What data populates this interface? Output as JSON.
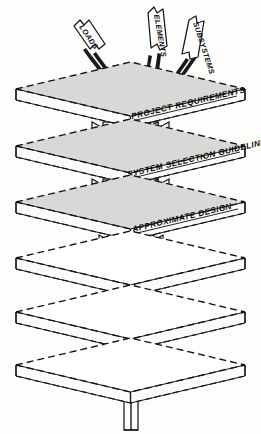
{
  "figure": {
    "background_color": "#fdfdfc",
    "ink_color": "#141414",
    "plate_shade_color": "#d8d8d6",
    "width": 261,
    "height": 434
  },
  "input_arrows": [
    {
      "id": "loads",
      "label": "LOADS"
    },
    {
      "id": "elements",
      "label": "ELEMENTS"
    },
    {
      "id": "subsystems",
      "label": "SUBSYSTEMS"
    }
  ],
  "plates": [
    {
      "index": 1,
      "label": "PROJECT  REQUIREMENTS",
      "shaded": true,
      "labeled": true
    },
    {
      "index": 2,
      "label": "SYSTEM  SELECTION  GUIDELINES",
      "shaded": true,
      "labeled": true
    },
    {
      "index": 3,
      "label": "APPROXIMATE  DESIGN",
      "shaded": true,
      "labeled": true
    },
    {
      "index": 4,
      "label": "",
      "shaded": false,
      "labeled": false
    },
    {
      "index": 5,
      "label": "",
      "shaded": false,
      "labeled": false
    },
    {
      "index": 6,
      "label": "",
      "shaded": false,
      "labeled": false
    }
  ],
  "columns": [
    {
      "index": 1,
      "between": "1-2",
      "width": "wide"
    },
    {
      "index": 2,
      "between": "2-3",
      "width": "wide"
    },
    {
      "index": 3,
      "between": "3-4",
      "width": "medium"
    },
    {
      "index": 4,
      "between": "4-5",
      "width": "medium"
    },
    {
      "index": 5,
      "between": "5-6",
      "width": "narrow"
    },
    {
      "index": 6,
      "between": "6-base",
      "width": "very-narrow"
    }
  ]
}
